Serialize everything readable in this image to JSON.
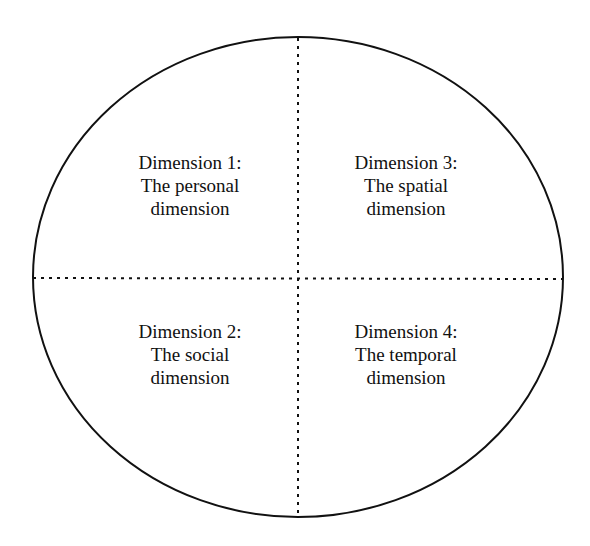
{
  "diagram": {
    "type": "quadrant-ellipse",
    "stroke_color": "#111111",
    "quadrants": [
      {
        "position": "top-left",
        "lines": [
          "Dimension 1:",
          "The personal",
          "dimension"
        ]
      },
      {
        "position": "top-right",
        "lines": [
          "Dimension 3:",
          "The spatial",
          "dimension"
        ]
      },
      {
        "position": "bottom-left",
        "lines": [
          "Dimension 2:",
          "The social",
          "dimension"
        ]
      },
      {
        "position": "bottom-right",
        "lines": [
          "Dimension 4:",
          "The temporal",
          "dimension"
        ]
      }
    ]
  }
}
